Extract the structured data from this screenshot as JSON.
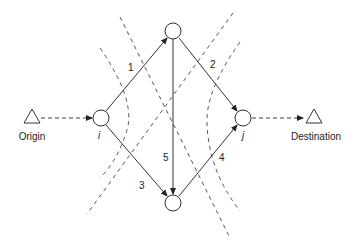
{
  "diagram": {
    "terminals": {
      "origin": {
        "label": "Origin",
        "x": 32,
        "y": 116
      },
      "destination": {
        "label": "Destination",
        "x": 314,
        "y": 116
      }
    },
    "nodes": {
      "i": {
        "label": "i",
        "x": 101,
        "y": 118
      },
      "j": {
        "label": "j",
        "x": 243,
        "y": 118
      },
      "top": {
        "label": "",
        "x": 173,
        "y": 31
      },
      "bottom": {
        "label": "",
        "x": 173,
        "y": 203
      }
    },
    "edges": [
      {
        "id": "1",
        "label": "1",
        "from": "i",
        "to": "top"
      },
      {
        "id": "2",
        "label": "2",
        "from": "top",
        "to": "j"
      },
      {
        "id": "3",
        "label": "3",
        "from": "i",
        "to": "bottom"
      },
      {
        "id": "4",
        "label": "4",
        "from": "bottom",
        "to": "j"
      },
      {
        "id": "5",
        "label": "5",
        "from": "top",
        "to": "bottom"
      }
    ],
    "flows": [
      {
        "from": "Origin",
        "to": "i",
        "style": "dashed"
      },
      {
        "from": "j",
        "to": "Destination",
        "style": "dashed"
      }
    ],
    "cuts": [
      {
        "name": "cut-left-arc",
        "style": "dashed"
      },
      {
        "name": "cut-line-descending",
        "style": "dashed"
      },
      {
        "name": "cut-line-ascending",
        "style": "dashed"
      },
      {
        "name": "cut-right-arc",
        "style": "dashed"
      }
    ]
  }
}
